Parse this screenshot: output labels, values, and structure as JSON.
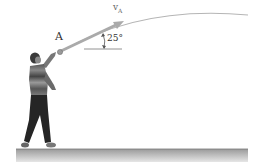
{
  "figure": {
    "point_label": "A",
    "velocity_label": "v",
    "velocity_subscript": "A",
    "angle_label": "25°",
    "colors": {
      "arrow": "#a8a8a8",
      "trajectory": "#b0b0b0",
      "ground_top": "#a0a0a0",
      "ground_bottom": "#e0e0e0",
      "ball": "#999999",
      "text": "#333333"
    }
  }
}
